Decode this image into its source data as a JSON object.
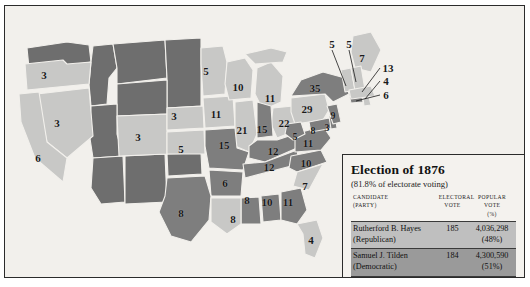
{
  "legend": {
    "title": "Election of 1876",
    "subtitle": "(81.8% of electorate voting)",
    "columns": {
      "candidate_l1": "CANDIDATE",
      "candidate_l2": "(PARTY)",
      "electoral_l1": "ELECTORAL",
      "electoral_l2": "VOTE",
      "popular_l1": "POPULAR VOTE",
      "popular_l2": "(%)"
    },
    "rows": [
      {
        "candidate": "Rutherford B. Hayes",
        "party": "(Republican)",
        "electoral_vote": "185",
        "popular_vote": "4,036,298",
        "popular_pct": "(48%)",
        "swatch_color": "#bfbfbf"
      },
      {
        "candidate": "Samuel J. Tilden",
        "party": "(Democratic)",
        "electoral_vote": "184",
        "popular_vote": "4,300,590",
        "popular_pct": "(51%)",
        "swatch_color": "#9a9a9a"
      }
    ]
  },
  "colors": {
    "hayes_light": "#c8c8c6",
    "tilden_dark": "#7e7e7e",
    "territory": "#6e6e6e",
    "background": "#f2f0ec",
    "border": "#2b2b2b",
    "state_outline": "#f2f0ec"
  },
  "map": {
    "states": [
      {
        "name": "oregon",
        "ev": "3",
        "winner": "hayes",
        "x": 39,
        "y": 69
      },
      {
        "name": "nevada",
        "ev": "3",
        "winner": "hayes",
        "x": 52,
        "y": 117
      },
      {
        "name": "california",
        "ev": "6",
        "winner": "hayes",
        "x": 33,
        "y": 152
      },
      {
        "name": "colorado",
        "ev": "3",
        "winner": "hayes",
        "x": 133,
        "y": 131
      },
      {
        "name": "nebraska",
        "ev": "3",
        "winner": "hayes",
        "x": 169,
        "y": 110
      },
      {
        "name": "kansas",
        "ev": "5",
        "winner": "hayes",
        "x": 176,
        "y": 143
      },
      {
        "name": "minnesota",
        "ev": "5",
        "winner": "hayes",
        "x": 201,
        "y": 65
      },
      {
        "name": "iowa",
        "ev": "11",
        "winner": "hayes",
        "x": 211,
        "y": 108
      },
      {
        "name": "missouri",
        "ev": "15",
        "winner": "tilden",
        "x": 219,
        "y": 139
      },
      {
        "name": "arkansas",
        "ev": "6",
        "winner": "tilden",
        "x": 220,
        "y": 177
      },
      {
        "name": "louisiana",
        "ev": "8",
        "winner": "hayes",
        "x": 228,
        "y": 213
      },
      {
        "name": "texas",
        "ev": "8",
        "winner": "tilden",
        "x": 176,
        "y": 207
      },
      {
        "name": "wisconsin",
        "ev": "10",
        "winner": "hayes",
        "x": 233,
        "y": 81
      },
      {
        "name": "illinois",
        "ev": "21",
        "winner": "hayes",
        "x": 237,
        "y": 124
      },
      {
        "name": "michigan",
        "ev": "11",
        "winner": "hayes",
        "x": 265,
        "y": 92
      },
      {
        "name": "indiana",
        "ev": "15",
        "winner": "tilden",
        "x": 257,
        "y": 123
      },
      {
        "name": "ohio",
        "ev": "22",
        "winner": "hayes",
        "x": 279,
        "y": 117
      },
      {
        "name": "kentucky",
        "ev": "12",
        "winner": "tilden",
        "x": 268,
        "y": 145
      },
      {
        "name": "tennessee",
        "ev": "12",
        "winner": "tilden",
        "x": 264,
        "y": 161
      },
      {
        "name": "mississippi",
        "ev": "8",
        "winner": "tilden",
        "x": 242,
        "y": 194
      },
      {
        "name": "alabama",
        "ev": "10",
        "winner": "tilden",
        "x": 262,
        "y": 196
      },
      {
        "name": "georgia",
        "ev": "11",
        "winner": "tilden",
        "x": 283,
        "y": 196
      },
      {
        "name": "florida",
        "ev": "4",
        "winner": "hayes",
        "x": 306,
        "y": 234
      },
      {
        "name": "south-carolina",
        "ev": "7",
        "winner": "hayes",
        "x": 300,
        "y": 180
      },
      {
        "name": "north-carolina",
        "ev": "10",
        "winner": "tilden",
        "x": 301,
        "y": 157
      },
      {
        "name": "virginia",
        "ev": "11",
        "winner": "tilden",
        "x": 303,
        "y": 137
      },
      {
        "name": "west-virginia",
        "ev": "5",
        "winner": "tilden",
        "x": 290,
        "y": 131
      },
      {
        "name": "maryland",
        "ev": "8",
        "winner": "tilden",
        "x": 308,
        "y": 125
      },
      {
        "name": "delaware",
        "ev": "3",
        "winner": "tilden",
        "x": 322,
        "y": 122
      },
      {
        "name": "pennsylvania",
        "ev": "29",
        "winner": "hayes",
        "x": 302,
        "y": 103
      },
      {
        "name": "new-jersey",
        "ev": "9",
        "winner": "tilden",
        "x": 328,
        "y": 110
      },
      {
        "name": "new-york",
        "ev": "35",
        "winner": "tilden",
        "x": 310,
        "y": 82
      },
      {
        "name": "maine",
        "ev": "7",
        "winner": "hayes",
        "x": 357,
        "y": 52
      }
    ],
    "callouts": [
      {
        "name": "vermont",
        "ev": "5",
        "winner": "hayes",
        "lx": 327,
        "ly": 38,
        "tx": 342,
        "ty": 84
      },
      {
        "name": "new-hampshire",
        "ev": "5",
        "winner": "hayes",
        "lx": 344,
        "ly": 38,
        "tx": 351,
        "ty": 78
      },
      {
        "name": "massachusetts",
        "ev": "13",
        "winner": "hayes",
        "lx": 381,
        "ly": 62,
        "tx": 356,
        "ty": 88
      },
      {
        "name": "rhode-island",
        "ev": "4",
        "winner": "hayes",
        "lx": 381,
        "ly": 75,
        "tx": 357,
        "ty": 94
      },
      {
        "name": "connecticut",
        "ev": "6",
        "winner": "tilden",
        "lx": 381,
        "ly": 89,
        "tx": 352,
        "ty": 96
      }
    ]
  }
}
